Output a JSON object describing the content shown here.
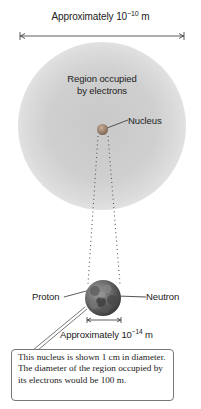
{
  "diagram": {
    "top_dimension": {
      "text": "Approximately 10",
      "exponent": "−10",
      "unit": " m"
    },
    "electron_cloud_label": [
      "Region occupied",
      "by electrons"
    ],
    "nucleus_label": "Nucleus",
    "proton_label": "Proton",
    "neutron_label": "Neutron",
    "bottom_dimension": {
      "text": "Approximately 10",
      "exponent": "−14",
      "unit": " m"
    },
    "callout_text": "This nucleus is shown 1 cm in diameter. The diameter of the region occupied by its electrons would be 100 m.",
    "colors": {
      "cloud": "#cccccc",
      "nucleus": "#8c7260",
      "text": "#222222"
    }
  }
}
